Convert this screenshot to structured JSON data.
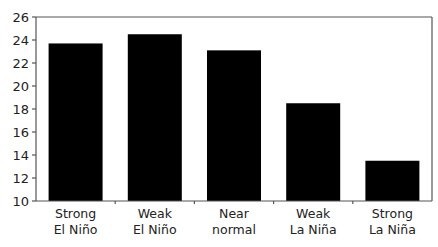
{
  "chart_data": {
    "type": "bar",
    "title": "",
    "xlabel": "",
    "ylabel": "",
    "categories": [
      "Strong El Niño",
      "Weak El Niño",
      "Near normal",
      "Weak La Niña",
      "Strong La Niña"
    ],
    "category_lines": [
      [
        "Strong",
        "El Niño"
      ],
      [
        "Weak",
        "El Niño"
      ],
      [
        "Near",
        "normal"
      ],
      [
        "Weak",
        "La Niña"
      ],
      [
        "Strong",
        "La Niña"
      ]
    ],
    "values": [
      23.7,
      24.5,
      23.1,
      18.5,
      13.5
    ],
    "ylim": [
      10,
      26
    ],
    "yticks": [
      10,
      12,
      14,
      16,
      18,
      20,
      22,
      24,
      26
    ],
    "grid": false,
    "legend": null,
    "bar_color": "#000000",
    "axis_color": "#555555"
  }
}
